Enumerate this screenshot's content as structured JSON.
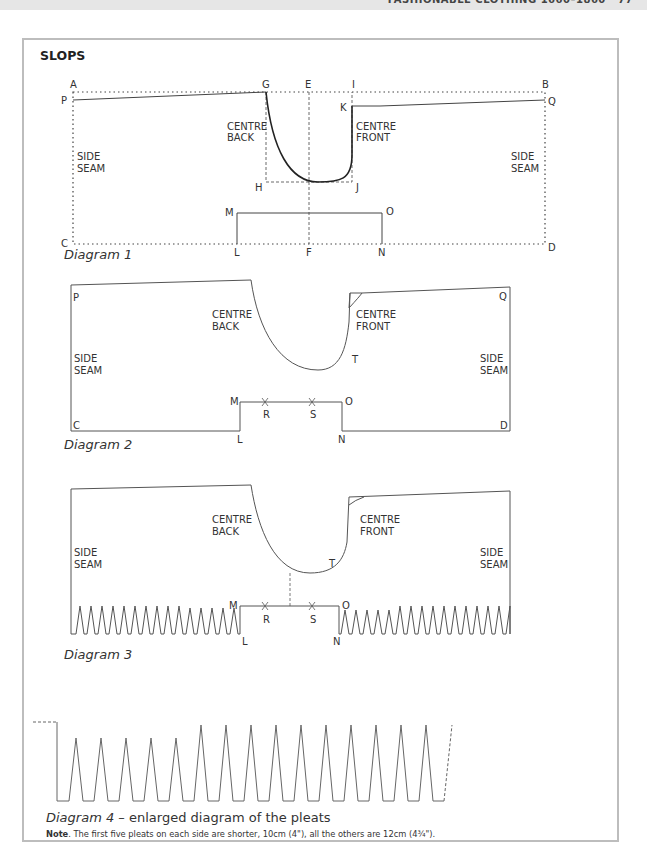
{
  "page_header": "FASHIONABLE CLOTHING 1660–1860 · 77",
  "section_title": "SLOPS",
  "diagram1": {
    "caption": "Diagram 1",
    "points": [
      "A",
      "B",
      "C",
      "D",
      "E",
      "F",
      "G",
      "H",
      "I",
      "J",
      "K",
      "L",
      "M",
      "N",
      "O",
      "P",
      "Q"
    ],
    "labels": {
      "centre_back": [
        "CENTRE",
        "BACK"
      ],
      "centre_front": [
        "CENTRE",
        "FRONT"
      ],
      "side_seam": [
        "SIDE",
        "SEAM"
      ]
    }
  },
  "diagram2": {
    "caption": "Diagram 2",
    "points": [
      "P",
      "Q",
      "C",
      "D",
      "M",
      "O",
      "L",
      "N",
      "R",
      "S",
      "T"
    ]
  },
  "diagram3": {
    "caption": "Diagram 3",
    "points": [
      "M",
      "O",
      "L",
      "N",
      "R",
      "S",
      "T"
    ]
  },
  "diagram4": {
    "caption_italic": "Diagram 4",
    "caption_rest": " – enlarged diagram of the pleats",
    "short_pleats": 5,
    "long_pleats": 9
  },
  "note": {
    "label": "Note",
    "text": ". The first five pleats on each side are shorter, 10cm (4\"), all the others are 12cm (4¾\")."
  },
  "labels": {
    "A": "A",
    "B": "B",
    "C": "C",
    "D": "D",
    "E": "E",
    "F": "F",
    "G": "G",
    "H": "H",
    "I": "I",
    "J": "J",
    "K": "K",
    "L": "L",
    "M": "M",
    "N": "N",
    "O": "O",
    "P": "P",
    "Q": "Q",
    "R": "R",
    "S": "S",
    "T": "T",
    "cb1": "CENTRE",
    "cb2": "BACK",
    "cf1": "CENTRE",
    "cf2": "FRONT",
    "ss1": "SIDE",
    "ss2": "SEAM"
  }
}
